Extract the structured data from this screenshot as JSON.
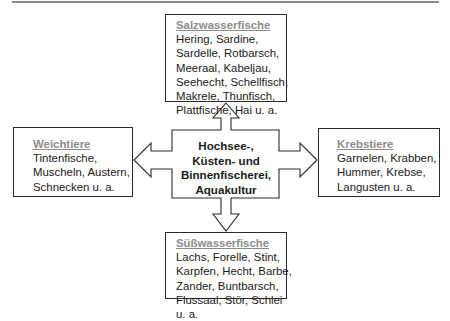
{
  "center": {
    "lines": [
      "Hochsee-,",
      "Küsten- und",
      "Binnenfischerei,",
      "Aquakultur"
    ]
  },
  "categories": {
    "top": {
      "title": "Salzwasserfische",
      "lines": [
        "Hering, Sardine,",
        "Sardelle, Rotbarsch,",
        "Meeraal, Kabeljau,",
        "Seehecht, Schellfisch,",
        "Makrele, Thunfisch,",
        "Plattfische, Hai u. a."
      ]
    },
    "left": {
      "title": "Weichtiere",
      "lines": [
        "Tintenfische,",
        "Muscheln, Austern,",
        "Schnecken u. a."
      ]
    },
    "right": {
      "title": "Krebstiere",
      "lines": [
        "Garnelen, Krabben,",
        "Hummer, Krebse,",
        "Langusten u. a."
      ]
    },
    "bottom": {
      "title": "Süßwasserfische",
      "lines": [
        "Lachs, Forelle, Stint,",
        "Karpfen, Hecht, Barbe,",
        "Zander, Buntbarsch,",
        "Flussaal, Stör, Schlei",
        "u. a."
      ]
    }
  },
  "colors": {
    "title_gray": "#8c8c8c",
    "border": "#2a2a2a",
    "rule": "#8a8a8a"
  }
}
